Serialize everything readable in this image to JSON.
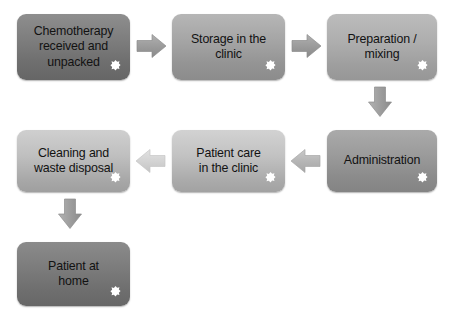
{
  "diagram": {
    "background_color": "#ffffff",
    "text_color": "#121212",
    "arrow_color": "#9b9b9b",
    "badge_color": "#ffffff"
  },
  "nodes": [
    {
      "id": "chemotherapy-received",
      "label": "Chemotherapy\nreceived and\nunpacked",
      "badge": "flower-icon",
      "fill_top": "#8e8e8e",
      "fill_bottom": "#666666"
    },
    {
      "id": "storage-in-clinic",
      "label": "Storage in the\nclinic",
      "badge": "flower-icon",
      "fill_top": "#b6b6b6",
      "fill_bottom": "#8c8c8c"
    },
    {
      "id": "preparation-mixing",
      "label": "Preparation /\nmixing",
      "badge": "flower-icon",
      "fill_top": "#bcbcbc",
      "fill_bottom": "#979797"
    },
    {
      "id": "administration",
      "label": "Administration",
      "badge": "flower-icon",
      "fill_top": "#aaaaaa",
      "fill_bottom": "#848484"
    },
    {
      "id": "patient-care-in-clinic",
      "label": "Patient care\nin the clinic",
      "badge": "flower-icon",
      "fill_top": "#d2d2d2",
      "fill_bottom": "#a2a2a2"
    },
    {
      "id": "cleaning-waste-disposal",
      "label": "Cleaning and\nwaste disposal",
      "badge": "flower-icon",
      "fill_top": "#cfcfcf",
      "fill_bottom": "#9f9f9f"
    },
    {
      "id": "patient-at-home",
      "label": "Patient at\nhome",
      "badge": "flower-icon",
      "fill_top": "#8b8b8b",
      "fill_bottom": "#676767"
    }
  ],
  "connectors": [
    {
      "id": "arrow-received-to-storage",
      "direction": "right",
      "from": "chemotherapy-received",
      "to": "storage-in-clinic"
    },
    {
      "id": "arrow-storage-to-preparation",
      "direction": "right",
      "from": "storage-in-clinic",
      "to": "preparation-mixing"
    },
    {
      "id": "arrow-preparation-to-administration",
      "direction": "down",
      "from": "preparation-mixing",
      "to": "administration"
    },
    {
      "id": "arrow-administration-to-care",
      "direction": "left",
      "from": "administration",
      "to": "patient-care-in-clinic"
    },
    {
      "id": "arrow-care-to-cleaning",
      "direction": "left",
      "from": "patient-care-in-clinic",
      "to": "cleaning-waste-disposal"
    },
    {
      "id": "arrow-cleaning-to-home",
      "direction": "down",
      "from": "cleaning-waste-disposal",
      "to": "patient-at-home"
    }
  ]
}
